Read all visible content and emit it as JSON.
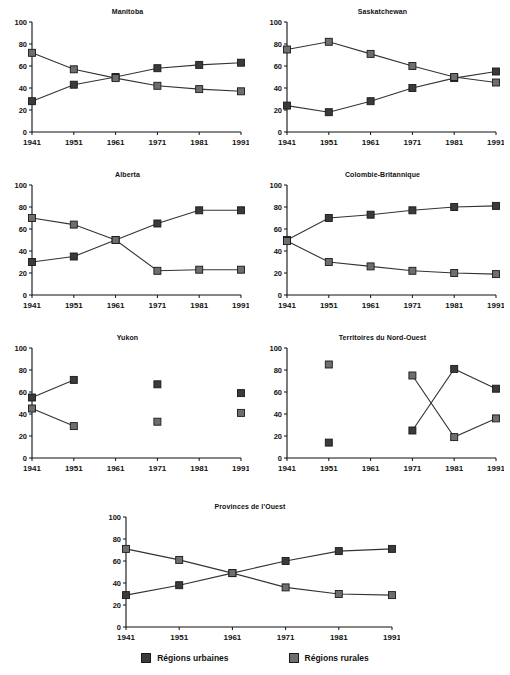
{
  "page": {
    "title": "",
    "background": "#ffffff"
  },
  "legend": {
    "position": "bottom",
    "items": [
      {
        "label": "Régions urbaines",
        "color": "#3a3a3a",
        "key": "urban"
      },
      {
        "label": "Régions rurales",
        "color": "#6e6e6e",
        "key": "rural"
      }
    ]
  },
  "axis": {
    "categories": [
      "1941",
      "1951",
      "1961",
      "1971",
      "1981",
      "1991"
    ],
    "yticks": [
      0,
      20,
      40,
      60,
      80,
      100
    ],
    "ylim": [
      0,
      100
    ],
    "xlabel": "",
    "ylabel": "",
    "grid": false
  },
  "chart_data": [
    {
      "type": "line",
      "title": "Manitoba",
      "xlabel": "",
      "ylabel": "",
      "ylim": [
        0,
        100
      ],
      "grid": false,
      "legend_position": "bottom",
      "categories": [
        "1941",
        "1951",
        "1961",
        "1971",
        "1981",
        "1991"
      ],
      "series": [
        {
          "name": "Régions urbaines",
          "values": [
            28,
            43,
            50,
            58,
            61,
            63
          ]
        },
        {
          "name": "Régions rurales",
          "values": [
            72,
            57,
            49,
            42,
            39,
            37
          ]
        }
      ]
    },
    {
      "type": "line",
      "title": "Saskatchewan",
      "xlabel": "",
      "ylabel": "",
      "ylim": [
        0,
        100
      ],
      "grid": false,
      "legend_position": "bottom",
      "categories": [
        "1941",
        "1951",
        "1961",
        "1971",
        "1981",
        "1991"
      ],
      "series": [
        {
          "name": "Régions urbaines",
          "values": [
            24,
            18,
            28,
            40,
            49,
            55
          ]
        },
        {
          "name": "Régions rurales",
          "values": [
            75,
            82,
            71,
            60,
            50,
            45
          ]
        }
      ]
    },
    {
      "type": "line",
      "title": "Alberta",
      "xlabel": "",
      "ylabel": "",
      "ylim": [
        0,
        100
      ],
      "grid": false,
      "legend_position": "bottom",
      "categories": [
        "1941",
        "1951",
        "1961",
        "1971",
        "1981",
        "1991"
      ],
      "series": [
        {
          "name": "Régions urbaines",
          "values": [
            30,
            35,
            50,
            65,
            77,
            77
          ]
        },
        {
          "name": "Régions rurales",
          "values": [
            70,
            64,
            50,
            22,
            23,
            23
          ]
        }
      ]
    },
    {
      "type": "line",
      "title": "Colombie-Britannique",
      "xlabel": "",
      "ylabel": "",
      "ylim": [
        0,
        100
      ],
      "grid": false,
      "legend_position": "bottom",
      "categories": [
        "1941",
        "1951",
        "1961",
        "1971",
        "1981",
        "1991"
      ],
      "series": [
        {
          "name": "Régions urbaines",
          "values": [
            50,
            70,
            73,
            77,
            80,
            81
          ]
        },
        {
          "name": "Régions rurales",
          "values": [
            49,
            30,
            26,
            22,
            20,
            19
          ]
        }
      ]
    },
    {
      "type": "line",
      "title": "Yukon",
      "xlabel": "",
      "ylabel": "",
      "ylim": [
        0,
        100
      ],
      "grid": false,
      "legend_position": "bottom",
      "categories": [
        "1941",
        "1951",
        "1961",
        "1971",
        "1981",
        "1991"
      ],
      "series": [
        {
          "name": "Régions urbaines",
          "values": [
            55,
            71,
            null,
            67,
            null,
            59
          ]
        },
        {
          "name": "Régions rurales",
          "values": [
            45,
            29,
            null,
            33,
            null,
            41
          ]
        }
      ]
    },
    {
      "type": "line",
      "title": "Territoires du Nord-Ouest",
      "xlabel": "",
      "ylabel": "",
      "ylim": [
        0,
        100
      ],
      "grid": false,
      "legend_position": "bottom",
      "categories": [
        "1941",
        "1951",
        "1961",
        "1971",
        "1981",
        "1991"
      ],
      "series": [
        {
          "name": "Régions urbaines",
          "values": [
            null,
            14,
            null,
            25,
            81,
            63
          ]
        },
        {
          "name": "Régions rurales",
          "values": [
            null,
            85,
            null,
            75,
            19,
            36
          ]
        }
      ]
    },
    {
      "type": "line",
      "title": "Provinces de l'Ouest",
      "xlabel": "",
      "ylabel": "",
      "ylim": [
        0,
        100
      ],
      "grid": false,
      "legend_position": "bottom",
      "categories": [
        "1941",
        "1951",
        "1961",
        "1971",
        "1981",
        "1991"
      ],
      "series": [
        {
          "name": "Régions urbaines",
          "values": [
            29,
            38,
            49,
            60,
            69,
            71
          ]
        },
        {
          "name": "Régions rurales",
          "values": [
            71,
            61,
            49,
            36,
            30,
            29
          ]
        }
      ]
    }
  ]
}
